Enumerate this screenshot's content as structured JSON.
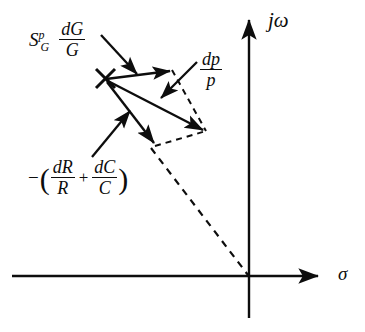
{
  "figure": {
    "type": "vector-diagram",
    "domain": "complex s-plane",
    "background_color": "#ffffff",
    "ink_color": "#0d0d0d"
  },
  "axes": {
    "vertical": {
      "name": "imaginary-axis",
      "label": "jω",
      "label_parts": {
        "j": "j",
        "omega": "ω"
      },
      "x_px": 249,
      "top_px": 13,
      "bottom_px": 318,
      "arrow": "up"
    },
    "horizontal": {
      "name": "real-axis",
      "label": "σ",
      "x_start_px": 12,
      "x_end_px": 325,
      "y_px": 276,
      "arrow": "right"
    },
    "origin": {
      "x_px": 249,
      "y_px": 276
    }
  },
  "pole": {
    "marker": "cross-x",
    "label": "pole",
    "x_px": 105,
    "y_px": 78
  },
  "vectors": [
    {
      "name": "dG-over-G-vector",
      "label": "S_G^p dG/G",
      "from": {
        "x": 105,
        "y": 78
      },
      "to": {
        "x": 173,
        "y": 72
      },
      "style": "solid",
      "arrow": true
    },
    {
      "name": "dp-over-p-vector",
      "label": "dp/p",
      "from": {
        "x": 105,
        "y": 78
      },
      "to": {
        "x": 205,
        "y": 130
      },
      "style": "solid",
      "arrow": true
    },
    {
      "name": "minus-dR-dC-vector",
      "label": "-(dR/R + dC/C)",
      "from": {
        "x": 105,
        "y": 78
      },
      "to": {
        "x": 156,
        "y": 145
      },
      "style": "solid",
      "arrow": true
    },
    {
      "name": "resultant-closure-upper",
      "from": {
        "x": 173,
        "y": 72
      },
      "to": {
        "x": 205,
        "y": 130
      },
      "style": "dashed",
      "arrow": false
    },
    {
      "name": "resultant-closure-lower",
      "from": {
        "x": 156,
        "y": 145
      },
      "to": {
        "x": 205,
        "y": 130
      },
      "style": "dashed",
      "arrow": false
    },
    {
      "name": "origin-ray-dashed",
      "from": {
        "x": 152,
        "y": 147
      },
      "to": {
        "x": 249,
        "y": 276
      },
      "style": "dashed",
      "arrow": false
    }
  ],
  "labels": {
    "sensitivity": {
      "name": "sensitivity-label",
      "symbol": "S",
      "superscript": "p",
      "subscript": "G",
      "numerator": "dG",
      "denominator": "G",
      "full_text": "S_G^p dG/G",
      "leader": {
        "from": {
          "x": 102,
          "y": 36
        },
        "to": {
          "x": 136,
          "y": 73
        },
        "arrow": true
      }
    },
    "dp_over_p": {
      "name": "dp-over-p-label",
      "numerator": "dp",
      "denominator": "p",
      "full_text": "dp/p",
      "leader": {
        "from": {
          "x": 196,
          "y": 63
        },
        "to": {
          "x": 163,
          "y": 96
        },
        "arrow": true
      }
    },
    "minus_rc": {
      "name": "minus-dR-dC-label",
      "minus": "−",
      "open_paren": "(",
      "close_paren": ")",
      "num1": "dR",
      "den1": "R",
      "plus": "+",
      "num2": "dC",
      "den2": "C",
      "full_text": "-(dR/R + dC/C)",
      "leader": {
        "from": {
          "x": 93,
          "y": 156
        },
        "to": {
          "x": 131,
          "y": 112
        },
        "arrow": true
      }
    }
  }
}
